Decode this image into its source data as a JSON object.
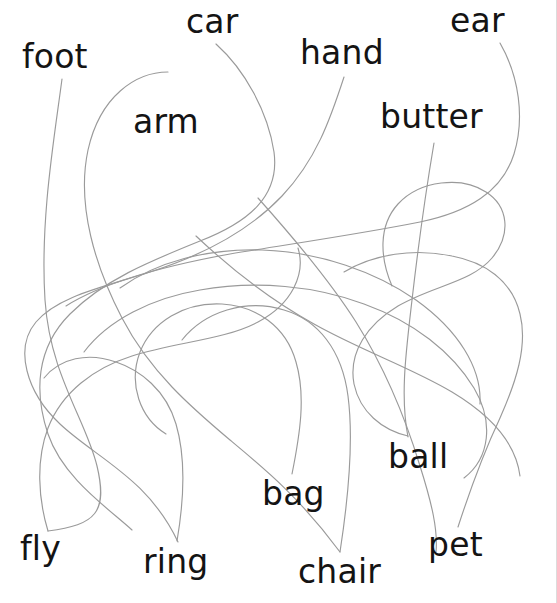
{
  "page": {
    "type": "follow-the-line matching worksheet",
    "width": 557,
    "height": 603,
    "background_color": "#ffffff",
    "line_color": "#9a9a9a",
    "text_color": "#141414",
    "border_color": "#dcdcdc"
  },
  "labels": [
    {
      "id": "foot",
      "text": "foot",
      "x": 22,
      "y": 40,
      "anchor_x": 62,
      "anchor_y": 78
    },
    {
      "id": "car",
      "text": "car",
      "x": 186,
      "y": 5,
      "anchor_x": 216,
      "anchor_y": 44
    },
    {
      "id": "hand",
      "text": "hand",
      "x": 300,
      "y": 36,
      "anchor_x": 344,
      "anchor_y": 76
    },
    {
      "id": "ear",
      "text": "ear",
      "x": 450,
      "y": 4,
      "anchor_x": 500,
      "anchor_y": 42
    },
    {
      "id": "arm",
      "text": "arm",
      "x": 133,
      "y": 105,
      "anchor_x": null,
      "anchor_y": null
    },
    {
      "id": "butter",
      "text": "butter",
      "x": 380,
      "y": 100,
      "anchor_x": 434,
      "anchor_y": 142
    },
    {
      "id": "ball",
      "text": "ball",
      "x": 388,
      "y": 440,
      "anchor_x": 408,
      "anchor_y": 436
    },
    {
      "id": "bag",
      "text": "bag",
      "x": 262,
      "y": 477,
      "anchor_x": 292,
      "anchor_y": 474
    },
    {
      "id": "fly",
      "text": "fly",
      "x": 20,
      "y": 532,
      "anchor_x": 48,
      "anchor_y": 530
    },
    {
      "id": "ring",
      "text": "ring",
      "x": 143,
      "y": 545,
      "anchor_x": 177,
      "anchor_y": 541
    },
    {
      "id": "chair",
      "text": "chair",
      "x": 298,
      "y": 555,
      "anchor_x": 340,
      "anchor_y": 552
    },
    {
      "id": "pet",
      "text": "pet",
      "x": 428,
      "y": 528,
      "anchor_x": 458,
      "anchor_y": 527
    }
  ],
  "curves": [
    {
      "id": "curve-foot",
      "from": "foot",
      "d": "M62,79 C54,140 40,220 45,300 C50,375 86,420 97,466 C108,512 96,525 48,531"
    },
    {
      "id": "curve-car",
      "from": "car",
      "d": "M216,44 C245,70 268,112 274,152 C280,196 249,222 200,241 C148,262 104,280 70,314 C36,348 34,392 48,434 C63,478 108,508 132,530"
    },
    {
      "id": "curve-arm",
      "from": "arm",
      "d": "M168,72 C136,72 100,96 88,150 C76,206 96,268 122,318 C150,372 192,408 230,440 C266,470 300,498 340,552"
    },
    {
      "id": "curve-hand",
      "from": "hand",
      "d": "M344,77 C330,120 316,160 282,196 C246,234 194,258 150,272 C104,287 58,296 36,322 C14,348 26,392 60,424 C96,458 148,478 178,542"
    },
    {
      "id": "curve-ear",
      "from": "ear",
      "d": "M500,43 C519,76 525,118 514,154 C502,192 468,212 420,222 C360,234 290,244 230,254 C164,266 104,282 66,306"
    },
    {
      "id": "curve-butter",
      "from": "butter",
      "d": "M434,143 C425,196 418,248 412,300 C406,352 400,396 408,437"
    },
    {
      "id": "curve-ball",
      "from": "ball",
      "d": "M408,436 C382,430 360,412 354,384 C348,352 368,324 398,306 C432,286 472,282 492,258 C512,234 508,206 486,192 C462,176 420,180 398,204 C378,226 380,258 392,286"
    },
    {
      "id": "curve-bag",
      "from": "bag",
      "d": "M292,474 C300,434 306,396 296,362 C286,326 256,306 222,304 C184,302 152,322 140,352 C128,384 140,418 166,434"
    },
    {
      "id": "curve-chair",
      "from": "chair",
      "d": "M340,552 C348,500 354,442 348,396 C342,350 318,320 284,310 C246,298 204,312 182,340"
    },
    {
      "id": "curve-fly",
      "from": "fly",
      "d": "M48,531 C38,498 36,460 48,428 C62,392 94,368 132,356 C176,342 224,340 258,322 C292,304 306,274 298,248"
    },
    {
      "id": "curve-ring",
      "from": "ring",
      "d": "M177,541 C184,500 186,458 176,424 C166,390 140,370 116,362 C88,352 60,358 44,378"
    },
    {
      "id": "curve-pet",
      "from": "pet",
      "d": "M458,527 C470,490 484,452 500,418 C516,382 528,346 520,314 C512,280 484,262 452,256 C414,248 374,254 344,272"
    },
    {
      "id": "curve-loop-a",
      "from": null,
      "d": "M84,352 C108,320 152,298 200,290 C256,280 316,286 364,304 C414,322 452,352 474,388 C494,422 490,458 464,478"
    },
    {
      "id": "curve-loop-b",
      "from": null,
      "d": "M196,236 C230,268 270,300 314,324 C360,350 412,368 452,392 C492,416 516,444 520,476"
    },
    {
      "id": "curve-loop-c",
      "from": null,
      "d": "M258,198 C292,236 328,278 356,322 C386,370 406,420 420,466 C432,504 438,530 436,552"
    },
    {
      "id": "curve-loop-d",
      "from": null,
      "d": "M120,288 C156,262 208,248 262,250 C320,252 376,272 416,300 C458,330 482,368 480,404"
    }
  ]
}
